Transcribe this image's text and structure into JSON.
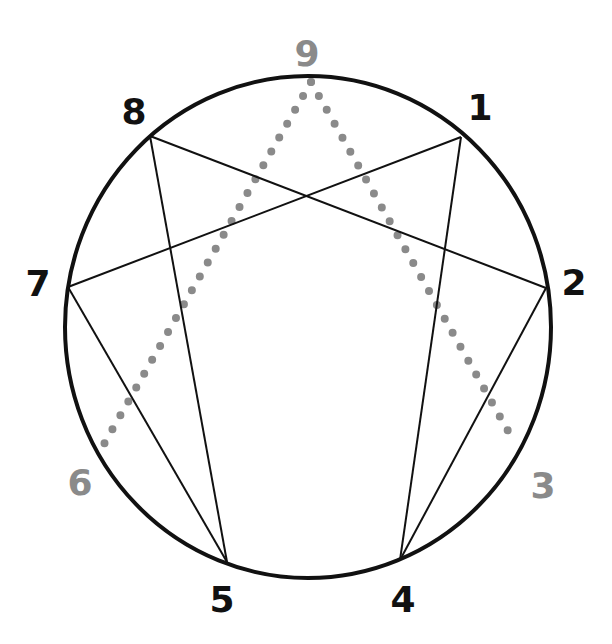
{
  "diagram": {
    "colors": {
      "primary": "#111111",
      "secondary": "#8a8a8a",
      "background": "#ffffff"
    },
    "circle": {
      "cx": 308,
      "cy": 327,
      "rx": 243,
      "ry": 251
    },
    "points": [
      {
        "id": "1",
        "label": "1",
        "x": 461,
        "y": 137,
        "lx": 480,
        "ly": 120,
        "style": "primary"
      },
      {
        "id": "2",
        "label": "2",
        "x": 546,
        "y": 288,
        "lx": 574,
        "ly": 295,
        "style": "primary"
      },
      {
        "id": "3",
        "label": "3",
        "x": 512,
        "y": 438,
        "lx": 543,
        "ly": 498,
        "style": "secondary"
      },
      {
        "id": "4",
        "label": "4",
        "x": 400,
        "y": 560,
        "lx": 403,
        "ly": 612,
        "style": "primary"
      },
      {
        "id": "5",
        "label": "5",
        "x": 227,
        "y": 562,
        "lx": 222,
        "ly": 612,
        "style": "primary"
      },
      {
        "id": "6",
        "label": "6",
        "x": 104,
        "y": 444,
        "lx": 80,
        "ly": 495,
        "style": "secondary"
      },
      {
        "id": "7",
        "label": "7",
        "x": 68,
        "y": 287,
        "lx": 38,
        "ly": 296,
        "style": "primary"
      },
      {
        "id": "8",
        "label": "8",
        "x": 150,
        "y": 136,
        "lx": 134,
        "ly": 124,
        "style": "primary"
      },
      {
        "id": "9",
        "label": "9",
        "x": 311,
        "y": 82,
        "lx": 307,
        "ly": 66,
        "style": "secondary"
      }
    ],
    "solid_lines": [
      [
        "1",
        "4"
      ],
      [
        "4",
        "2"
      ],
      [
        "2",
        "8"
      ],
      [
        "8",
        "5"
      ],
      [
        "5",
        "7"
      ],
      [
        "7",
        "1"
      ]
    ],
    "hexad_path": [
      "1",
      "4",
      "2",
      "8",
      "5",
      "7",
      "1"
    ],
    "dotted_lines": [
      [
        "9",
        "3"
      ],
      [
        "9",
        "6"
      ]
    ],
    "intersections_note": "Lines 1-5 and 8-4 cross near center"
  }
}
